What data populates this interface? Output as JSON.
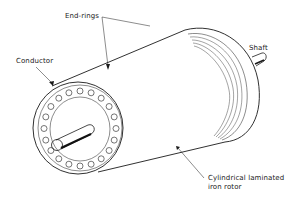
{
  "figure": {
    "labels": {
      "end_rings": "End-rings",
      "conductor": "Conductor",
      "shaft": "Shaft",
      "rotor_line1": "Cylindrical laminated",
      "rotor_line2": "iron rotor"
    },
    "colors": {
      "line": "#1a1a1a",
      "background": "#ffffff"
    },
    "conductor_count": 20
  }
}
